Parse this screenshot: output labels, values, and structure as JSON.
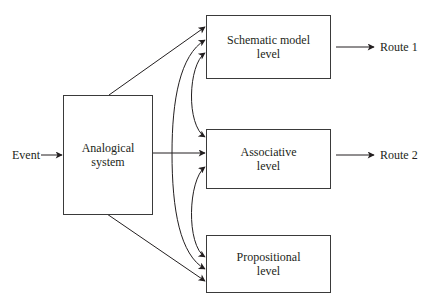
{
  "diagram": {
    "input": {
      "label": "Event"
    },
    "source": {
      "line1": "Analogical",
      "line2": "system"
    },
    "levels": [
      {
        "id": "schematic",
        "line1": "Schematic model",
        "line2": "level"
      },
      {
        "id": "associative",
        "line1": "Associative",
        "line2": "level"
      },
      {
        "id": "propositional",
        "line1": "Propositional",
        "line2": "level"
      }
    ],
    "outputs": [
      {
        "from": "schematic",
        "label": "Route 1"
      },
      {
        "from": "associative",
        "label": "Route 2"
      }
    ],
    "edges": [
      {
        "from": "Event",
        "to": "Analogical system",
        "type": "arrow"
      },
      {
        "from": "Analogical system",
        "to": "Schematic model level",
        "type": "arrow"
      },
      {
        "from": "Analogical system",
        "to": "Associative level",
        "type": "arrow"
      },
      {
        "from": "Analogical system",
        "to": "Propositional level",
        "type": "arrow"
      },
      {
        "from": "Associative level (branch)",
        "to": "Schematic model level",
        "type": "curved-arrow"
      },
      {
        "from": "Associative level (branch)",
        "to": "Propositional level",
        "type": "curved-arrow"
      },
      {
        "from": "Schematic model level",
        "to": "Associative level",
        "type": "bidirectional-curve"
      },
      {
        "from": "Associative level",
        "to": "Propositional level",
        "type": "bidirectional-curve"
      },
      {
        "from": "Schematic model level",
        "to": "Route 1",
        "type": "arrow"
      },
      {
        "from": "Associative level",
        "to": "Route 2",
        "type": "arrow"
      }
    ],
    "colors": {
      "line": "#231f20",
      "box_border": "#3a3a3a",
      "background": "#ffffff"
    }
  }
}
